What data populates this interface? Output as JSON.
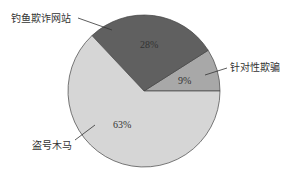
{
  "chart_data": {
    "type": "pie",
    "title": "",
    "categories": [
      "针对性欺骗",
      "钓鱼欺诈网站",
      "盗号木马"
    ],
    "values": [
      9,
      28,
      63
    ],
    "labels": [
      "9%",
      "28%",
      "63%"
    ],
    "colors": [
      "#a8a8a8",
      "#606060",
      "#d6d6d6"
    ],
    "legend": "none (leader-line labels)"
  },
  "labels": {
    "targeted": "针对性欺骗",
    "phishing": "钓鱼欺诈网站",
    "trojan": "盗号木马",
    "pct_targeted": "9%",
    "pct_phishing": "28%",
    "pct_trojan": "63%"
  }
}
